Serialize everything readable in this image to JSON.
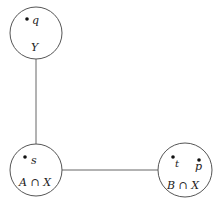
{
  "diagram": {
    "nodes": [
      {
        "id": "Y",
        "label": "Y",
        "cx": 36,
        "cy": 33,
        "r": 26,
        "points": [
          {
            "name": "q",
            "dot": [
              27,
              19
            ],
            "text": [
              32,
              22
            ]
          }
        ]
      },
      {
        "id": "AX",
        "label": "A ∩ X",
        "cx": 36,
        "cy": 170,
        "r": 26,
        "points": [
          {
            "name": "s",
            "dot": [
              25,
              157
            ],
            "text": [
              31,
              163
            ]
          }
        ]
      },
      {
        "id": "BX",
        "label": "B ∩ X",
        "cx": 185,
        "cy": 170,
        "r": 27,
        "points": [
          {
            "name": "t",
            "dot": [
              173,
              158
            ],
            "text": [
              175,
              166
            ]
          },
          {
            "name": "p",
            "dot": [
              199,
              160
            ],
            "text": [
              196,
              168
            ]
          }
        ]
      }
    ],
    "edges": [
      {
        "from": "Y",
        "to": "AX"
      },
      {
        "from": "AX",
        "to": "BX"
      }
    ],
    "colors": {
      "stroke": "#555555",
      "text": "#222222",
      "dot": "#111111"
    }
  }
}
